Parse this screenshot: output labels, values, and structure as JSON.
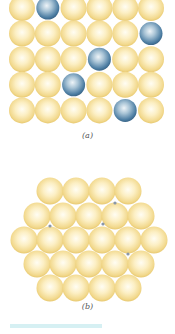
{
  "figure": {
    "panel_a": {
      "caption": "(a)",
      "description": "Substitutional solid solution, square lattice",
      "lattice": {
        "cols": 6,
        "rows": 5,
        "x0": 22,
        "y0": 8,
        "dx": 25.8,
        "dy": 25.6,
        "r": 13
      },
      "solute_atoms": [
        [
          0,
          1
        ],
        [
          1,
          5
        ],
        [
          2,
          3
        ],
        [
          3,
          2
        ],
        [
          4,
          4
        ]
      ],
      "solute_radius": 11.5
    },
    "panel_b": {
      "caption": "(b)",
      "description": "Interstitial solid solution, close-packed lattice",
      "rows": [
        {
          "y": 191,
          "xs": [
            50,
            76,
            102,
            128
          ]
        },
        {
          "y": 216,
          "xs": [
            37,
            63,
            89,
            115,
            141
          ]
        },
        {
          "y": 240,
          "xs": [
            24,
            50,
            76,
            102,
            128,
            154
          ]
        },
        {
          "y": 264,
          "xs": [
            37,
            63,
            89,
            115,
            141
          ]
        },
        {
          "y": 288,
          "xs": [
            50,
            76,
            102,
            128
          ]
        }
      ],
      "r": 13.5,
      "interstitials": [
        [
          115,
          203
        ],
        [
          50,
          226
        ],
        [
          103,
          224
        ],
        [
          128,
          254
        ]
      ]
    },
    "colors": {
      "host_light": "#fffbe6",
      "host_mid": "#f7e3a3",
      "host_dark": "#e9c96a",
      "solute_light": "#e6f0f7",
      "solute_mid": "#8fb3cc",
      "solute_dark": "#3f6f94",
      "interstitial": "#8a97a8",
      "strip": "#d6f0f3"
    }
  }
}
